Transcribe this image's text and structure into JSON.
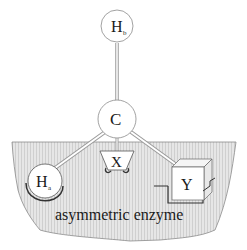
{
  "diagram": {
    "title": "asymmetric enzyme",
    "atoms": {
      "top": {
        "symbol": "H",
        "subscript": "b"
      },
      "center": {
        "symbol": "C"
      },
      "left": {
        "symbol": "H",
        "subscript": "a"
      },
      "middle": {
        "symbol": "X"
      },
      "right": {
        "symbol": "Y"
      }
    },
    "enzyme_label": "asymmetric enzyme",
    "colors": {
      "enzyme_fill": "#dcdcdc",
      "outline": "#555555",
      "bond": "#bdbdbd",
      "atom_fill": "#ffffff"
    }
  }
}
